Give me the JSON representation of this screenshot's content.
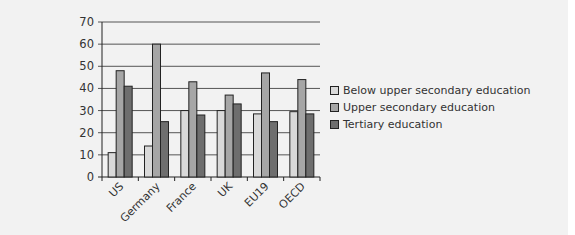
{
  "chart_data": {
    "type": "bar",
    "title": "",
    "xlabel": "",
    "ylabel": "",
    "ylim": [
      0,
      70
    ],
    "yticks": [
      0,
      10,
      20,
      30,
      40,
      50,
      60,
      70
    ],
    "grid": true,
    "legend_position": "right",
    "categories": [
      "US",
      "Germany",
      "France",
      "UK",
      "EU19",
      "OECD"
    ],
    "series": [
      {
        "name": "Below upper secondary education",
        "color": "#d9d9d9",
        "values": [
          11,
          14,
          30,
          30,
          28.5,
          29.5
        ]
      },
      {
        "name": "Upper secondary education",
        "color": "#a6a6a6",
        "values": [
          48,
          60,
          43,
          37,
          47,
          44
        ]
      },
      {
        "name": "Tertiary education",
        "color": "#6e6e6e",
        "values": [
          41,
          25,
          28,
          33,
          25,
          28.5
        ]
      }
    ]
  }
}
